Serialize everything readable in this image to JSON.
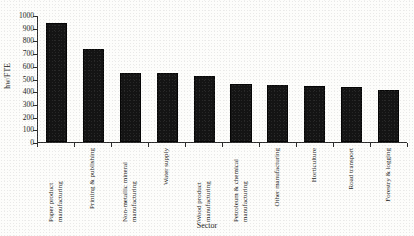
{
  "chart_data": {
    "type": "bar",
    "title": "",
    "subtitle": "",
    "xlabel": "Sector",
    "ylabel": "hw/FTE",
    "ylim": [
      0,
      1000
    ],
    "yticks": [
      0,
      100,
      200,
      300,
      400,
      500,
      600,
      700,
      800,
      900,
      1000
    ],
    "grid": false,
    "legend": null,
    "orientation": "vertical",
    "bar_color": "#141414",
    "categories": [
      "Paper product manufacturing",
      "Printing & publishing",
      "Non-metallic mineral manufacturing",
      "Water supply",
      "Wood product manufacturing",
      "Petroleum & chemical manufacturing",
      "Other manufacturing",
      "Horticulture",
      "Road transport",
      "Forestry & logging"
    ],
    "values": [
      935,
      730,
      545,
      540,
      520,
      460,
      450,
      440,
      435,
      410
    ]
  },
  "axes": {
    "y_title": "hw/FTE",
    "x_title": "Sector",
    "y_tick_labels": [
      "1000",
      "900",
      "800",
      "700",
      "600",
      "500",
      "400",
      "300",
      "200",
      "100",
      "0"
    ]
  }
}
